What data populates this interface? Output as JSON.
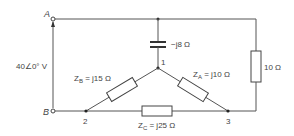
{
  "diagram": {
    "type": "circuit",
    "nodes": {
      "A": {
        "label": "A"
      },
      "B": {
        "label": "B"
      },
      "n1": {
        "label": "1"
      },
      "n2": {
        "label": "2"
      },
      "n3": {
        "label": "3"
      }
    },
    "source": {
      "label": "40∠0° V"
    },
    "components": {
      "capacitor": {
        "label": "−j8 Ω"
      },
      "resistor_right": {
        "label": "10 Ω"
      },
      "z_b": {
        "sym": "Z",
        "sub": "B",
        "value": " = j15 Ω"
      },
      "z_a": {
        "sym": "Z",
        "sub": "A",
        "value": " = j10 Ω"
      },
      "z_c": {
        "sym": "Z",
        "sub": "C",
        "value": " = j25 Ω"
      }
    },
    "colors": {
      "line": "#555555",
      "text": "#444444",
      "background": "#ffffff"
    }
  }
}
